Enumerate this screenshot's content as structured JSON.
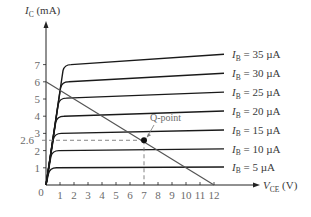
{
  "chart_data": {
    "type": "line",
    "title": "",
    "xlabel": "V_CE (V)",
    "ylabel": "I_C (mA)",
    "xlim": [
      0,
      12
    ],
    "ylim": [
      0,
      7.5
    ],
    "x_ticks": [
      "0",
      "1",
      "2",
      "3",
      "4",
      "5",
      "6",
      "7",
      "8",
      "9",
      "10",
      "11",
      "12"
    ],
    "y_ticks": [
      "1",
      "2",
      "3",
      "4",
      "5",
      "6",
      "7"
    ],
    "grid": false,
    "series": [
      {
        "name": "I_B = 35 µA",
        "label_main": "I",
        "label_sub": "B",
        "label_rest": " = 35 µA",
        "sat_mA": 7.0,
        "end_mA": 7.6
      },
      {
        "name": "I_B = 30 µA",
        "label_main": "I",
        "label_sub": "B",
        "label_rest": " = 30 µA",
        "sat_mA": 6.0,
        "end_mA": 6.5
      },
      {
        "name": "I_B = 25 µA",
        "label_main": "I",
        "label_sub": "B",
        "label_rest": " = 25 µA",
        "sat_mA": 5.05,
        "end_mA": 5.4
      },
      {
        "name": "I_B = 20 µA",
        "label_main": "I",
        "label_sub": "B",
        "label_rest": " = 20 µA",
        "sat_mA": 4.0,
        "end_mA": 4.3
      },
      {
        "name": "I_B = 15 µA",
        "label_main": "I",
        "label_sub": "B",
        "label_rest": " = 15 µA",
        "sat_mA": 3.0,
        "end_mA": 3.2
      },
      {
        "name": "I_B = 10 µA",
        "label_main": "I",
        "label_sub": "B",
        "label_rest": " = 10 µA",
        "sat_mA": 2.0,
        "end_mA": 2.1
      },
      {
        "name": "I_B = 5 µA",
        "label_main": "I",
        "label_sub": "B",
        "label_rest": " = 5 µA",
        "sat_mA": 1.0,
        "end_mA": 1.05
      }
    ],
    "load_line": {
      "x": [
        0,
        12
      ],
      "y": [
        6,
        0
      ]
    },
    "q_point": {
      "label": "Q-point",
      "vce": 7,
      "ic": 2.6,
      "ic_label": "2.6"
    },
    "annotations": [
      "Q-point",
      "2.6"
    ]
  },
  "axes": {
    "y_label_main": "I",
    "y_label_sub": "C",
    "y_label_rest": " (mA)",
    "x_label_main": "V",
    "x_label_sub": "CE",
    "x_label_rest": " (V)",
    "origin_label": "0"
  }
}
